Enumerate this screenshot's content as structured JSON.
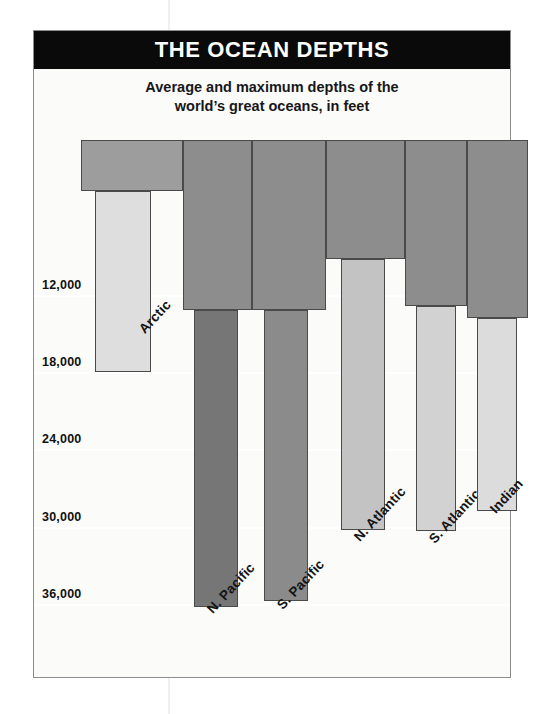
{
  "title": "THE OCEAN DEPTHS",
  "subtitle_lines": [
    "Average and maximum depths of the",
    "world’s great oceans, in feet"
  ],
  "colors": {
    "banner_background": "#0a0a0a",
    "banner_text": "#ffffff",
    "panel_background": "#fbfbf9",
    "frame": "#8d8d8d",
    "bar_outline": "#4a4a4a",
    "avg_fill_default": "#9a9a9a",
    "max_fill_default": "#d8d8d6",
    "gridline": "#ffffff",
    "axis_text": "#111111"
  },
  "chart_data": {
    "type": "bar",
    "title": "THE OCEAN DEPTHS",
    "subtitle": "Average and maximum depths of the world’s great oceans, in feet",
    "xlabel": "",
    "ylabel": "",
    "units": "feet",
    "y_inverted": true,
    "ylim": [
      0,
      38000
    ],
    "grid": true,
    "legend_position": "none",
    "yticks": [
      12000,
      18000,
      24000,
      30000,
      36000
    ],
    "ytick_labels": [
      "12,000",
      "18,000",
      "24,000",
      "30,000",
      "36,000"
    ],
    "categories": [
      "Arctic",
      "N. Pacific",
      "S. Pacific",
      "N. Atlantic",
      "S. Atlantic",
      "Indian"
    ],
    "series": [
      {
        "name": "Average depth",
        "values": [
          3950,
          13200,
          13200,
          9200,
          12900,
          13800
        ]
      },
      {
        "name": "Maximum depth",
        "values": [
          18000,
          36200,
          35800,
          30250,
          30350,
          28800
        ]
      }
    ]
  },
  "bars": [
    {
      "category": "Arctic",
      "avg": 3950,
      "max": 18000,
      "avg_fill": "#9d9d9d",
      "max_fill": "#dedede",
      "left": 47,
      "avg_width": 102,
      "max_left": 14,
      "max_width": 56,
      "label_x": 55,
      "label_y": 196
    },
    {
      "category": "N. Pacific",
      "avg": 13200,
      "max": 36200,
      "avg_fill": "#8d8d8d",
      "max_fill": "#767676",
      "left": 149,
      "avg_width": 69,
      "max_left": 11,
      "max_width": 44,
      "label_x": 21,
      "label_y": 476
    },
    {
      "category": "S. Pacific",
      "avg": 13200,
      "max": 35800,
      "avg_fill": "#8d8d8d",
      "max_fill": "#8b8b8b",
      "left": 218,
      "avg_width": 74,
      "max_left": 12,
      "max_width": 44,
      "label_x": 22,
      "label_y": 472
    },
    {
      "category": "N. Atlantic",
      "avg": 9200,
      "max": 30250,
      "avg_fill": "#8d8d8d",
      "max_fill": "#c3c3c3",
      "left": 292,
      "avg_width": 79,
      "max_left": 15,
      "max_width": 44,
      "label_x": 25,
      "label_y": 404
    },
    {
      "category": "S. Atlantic",
      "avg": 12900,
      "max": 30350,
      "avg_fill": "#8d8d8d",
      "max_fill": "#d2d2d2",
      "left": 371,
      "avg_width": 62,
      "max_left": 11,
      "max_width": 40,
      "label_x": 21,
      "label_y": 406
    },
    {
      "category": "Indian",
      "avg": 13800,
      "max": 28800,
      "avg_fill": "#8d8d8d",
      "max_fill": "#dcdcdc",
      "left": 433,
      "avg_width": 61,
      "max_left": 10,
      "max_width": 40,
      "label_x": 20,
      "label_y": 376
    }
  ]
}
